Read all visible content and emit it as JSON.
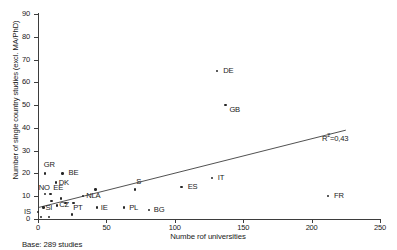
{
  "chart_data": {
    "type": "scatter",
    "title": "",
    "xlabel": "Numbe rof universities",
    "ylabel": "Number of single country studies (excl. MA/PhD)",
    "xlim": [
      0,
      250
    ],
    "ylim": [
      0,
      90
    ],
    "xticks": [
      "0",
      "50",
      "100",
      "150",
      "200",
      "250"
    ],
    "yticks": [
      "0",
      "10",
      "20",
      "30",
      "40",
      "50",
      "60",
      "70",
      "80",
      "90"
    ],
    "grid": false,
    "legend": "none",
    "annotation": "R2=0,43",
    "r_squared_prefix": "R",
    "r_squared_exponent": "2",
    "r_squared_value": "=0,43",
    "base_note": "Base: 289 studies",
    "trendline": {
      "x0": 0,
      "y0": 5,
      "x1": 225,
      "y1": 39
    },
    "points": [
      {
        "label": "DE",
        "x": 131,
        "y": 65,
        "lx": 6,
        "ly": -4
      },
      {
        "label": "GB",
        "x": 137,
        "y": 50,
        "lx": 4,
        "ly": 1
      },
      {
        "label": "FR",
        "x": 212,
        "y": 10,
        "lx": 6,
        "ly": -4
      },
      {
        "label": "IT",
        "x": 127,
        "y": 18,
        "lx": 6,
        "ly": -4
      },
      {
        "label": "ES",
        "x": 105,
        "y": 14,
        "lx": 6,
        "ly": -4
      },
      {
        "label": "S",
        "x": 71,
        "y": 13,
        "lx": 1,
        "ly": -11
      },
      {
        "label": "A",
        "x": 42,
        "y": 13,
        "lx": 0,
        "ly": 3
      },
      {
        "label": "GR",
        "x": 5,
        "y": 20,
        "lx": -1,
        "ly": -12
      },
      {
        "label": "BE",
        "x": 18,
        "y": 20,
        "lx": 6,
        "ly": -4
      },
      {
        "label": "DK",
        "x": 13,
        "y": 16,
        "lx": 3,
        "ly": -4
      },
      {
        "label": "NO",
        "x": 5,
        "y": 11,
        "lx": -6,
        "ly": -10
      },
      {
        "label": "EE",
        "x": 9,
        "y": 11,
        "lx": 3,
        "ly": -10
      },
      {
        "label": "NL",
        "x": 33,
        "y": 10,
        "lx": 3,
        "ly": -4
      },
      {
        "label": "SI",
        "x": 4,
        "y": 5,
        "lx": 2,
        "ly": -4
      },
      {
        "label": "CZ",
        "x": 14,
        "y": 6,
        "lx": 2,
        "ly": -4
      },
      {
        "label": "IE",
        "x": 43,
        "y": 5,
        "lx": 4,
        "ly": -4
      },
      {
        "label": "PL",
        "x": 63,
        "y": 5,
        "lx": 5,
        "ly": -4
      },
      {
        "label": "BG",
        "x": 81,
        "y": 4,
        "lx": 5,
        "ly": -4
      },
      {
        "label": "PT",
        "x": 25,
        "y": 2,
        "lx": 1,
        "ly": -10
      },
      {
        "label": "IS",
        "x": 0,
        "y": 3,
        "lx": -14,
        "ly": -4
      },
      {
        "label": "",
        "x": 2,
        "y": 1,
        "lx": 0,
        "ly": 0
      },
      {
        "label": "",
        "x": 8,
        "y": 1,
        "lx": 0,
        "ly": 0
      },
      {
        "label": "",
        "x": 20,
        "y": 7,
        "lx": 0,
        "ly": 0
      },
      {
        "label": "",
        "x": 26,
        "y": 7,
        "lx": 0,
        "ly": 0
      },
      {
        "label": "",
        "x": 10,
        "y": 8,
        "lx": 0,
        "ly": 0
      },
      {
        "label": "",
        "x": 17,
        "y": 9,
        "lx": 0,
        "ly": 0
      }
    ]
  }
}
